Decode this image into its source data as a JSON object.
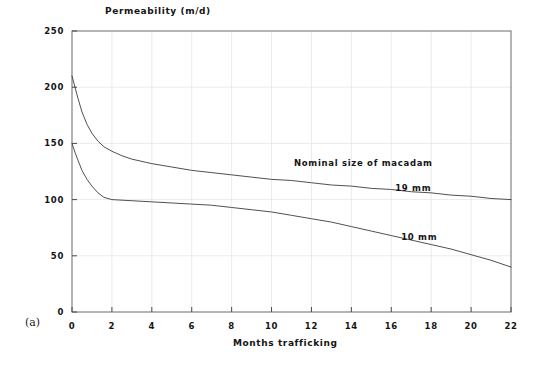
{
  "chart_data": {
    "type": "line",
    "title": "",
    "xlabel": "Months trafficking",
    "ylabel": "Permeability (m/d)",
    "xlim": [
      0,
      22
    ],
    "ylim": [
      0,
      250
    ],
    "xticks": [
      0,
      2,
      4,
      6,
      8,
      10,
      12,
      14,
      16,
      18,
      20,
      22
    ],
    "yticks": [
      0,
      50,
      100,
      150,
      200,
      250
    ],
    "xtick_labels": [
      "0",
      "2",
      "4",
      "6",
      "8",
      "10",
      "12",
      "14",
      "16",
      "18",
      "20",
      "22"
    ],
    "ytick_labels": [
      "0",
      "50",
      "100",
      "150",
      "200",
      "250"
    ],
    "grid": true,
    "grid_style": "faint vertical and horizontal gridlines",
    "legend": "inline labels on curves",
    "legend_position": "right-center inside plot",
    "annotations": [
      {
        "text": "Nominal size of macadam",
        "x": 14.6,
        "y": 133
      },
      {
        "text": "19 mm",
        "x": 17.1,
        "y": 110
      },
      {
        "text": "10 mm",
        "x": 17.4,
        "y": 67
      },
      {
        "text": "(a)",
        "x": -1.6,
        "y": -5
      }
    ],
    "series": [
      {
        "name": "19 mm",
        "label": "19 mm",
        "color": "#3c3c3c",
        "x": [
          0,
          0.15,
          0.3,
          0.5,
          0.75,
          1.0,
          1.3,
          1.6,
          2.0,
          2.5,
          3.0,
          4.0,
          5.0,
          6.0,
          7.0,
          8.0,
          9.0,
          10.0,
          11.0,
          12.0,
          13.0,
          14.0,
          15.0,
          16.0,
          17.0,
          18.0,
          19.0,
          20.0,
          21.0,
          22.0
        ],
        "values": [
          210,
          200,
          190,
          178,
          167,
          159,
          152,
          147,
          143,
          139,
          136,
          132,
          129,
          126,
          124,
          122,
          120,
          118,
          117,
          115,
          113,
          112,
          110,
          109,
          107,
          106,
          104,
          103,
          101,
          100
        ]
      },
      {
        "name": "10 mm",
        "label": "10 mm",
        "color": "#3c3c3c",
        "x": [
          0,
          0.15,
          0.3,
          0.5,
          0.75,
          1.0,
          1.3,
          1.6,
          2.0,
          3.0,
          4.0,
          5.0,
          6.0,
          7.0,
          8.0,
          9.0,
          10.0,
          11.0,
          12.0,
          13.0,
          14.0,
          15.0,
          16.0,
          17.0,
          18.0,
          19.0,
          20.0,
          21.0,
          22.0
        ],
        "values": [
          150,
          142,
          135,
          126,
          118,
          112,
          106,
          102,
          100,
          99,
          98,
          97,
          96,
          95,
          93,
          91,
          89,
          86,
          83,
          80,
          76,
          72,
          68,
          64,
          60,
          56,
          51,
          46,
          40
        ]
      }
    ]
  },
  "figure": {
    "panel_label": "(a)"
  }
}
